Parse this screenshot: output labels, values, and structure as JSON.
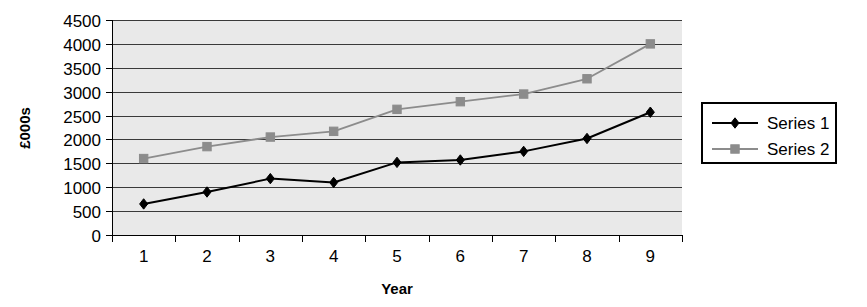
{
  "chart_data": {
    "type": "line",
    "title": "",
    "xlabel": "Year",
    "ylabel": "£000s",
    "categories": [
      "1",
      "2",
      "3",
      "4",
      "5",
      "6",
      "7",
      "8",
      "9"
    ],
    "series": [
      {
        "name": "Series 1",
        "color": "#000000",
        "marker": "diamond",
        "values": [
          650,
          900,
          1180,
          1100,
          1520,
          1570,
          1750,
          2020,
          2570
        ]
      },
      {
        "name": "Series 2",
        "color": "#8c8c8c",
        "marker": "square",
        "values": [
          1600,
          1850,
          2050,
          2170,
          2630,
          2790,
          2950,
          3270,
          4000
        ]
      }
    ],
    "ylim": [
      0,
      4500
    ],
    "ytick_step": 500,
    "yticks": [
      "0",
      "500",
      "1000",
      "1500",
      "2000",
      "2500",
      "3000",
      "3500",
      "4000",
      "4500"
    ],
    "grid": true,
    "grid_axis": "y",
    "legend_position": "right",
    "plot_background": "#e9e9e9",
    "figure_background": "#ffffff"
  },
  "legend": {
    "entries": [
      {
        "label": "Series 1"
      },
      {
        "label": "Series 2"
      }
    ]
  }
}
